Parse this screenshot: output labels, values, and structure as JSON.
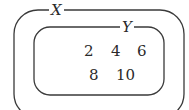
{
  "diagram": {
    "outer_set": {
      "label": "X"
    },
    "inner_set": {
      "label": "Y"
    },
    "elements": {
      "row1": [
        "2",
        "4",
        "6"
      ],
      "row2": [
        "8",
        "10"
      ]
    },
    "stroke_color": "#3a3a3a"
  }
}
